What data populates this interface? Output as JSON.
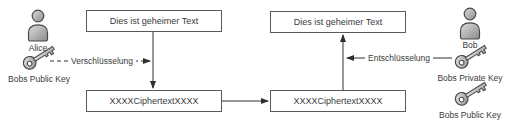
{
  "diagram": {
    "title_hint": "public-key encryption flow",
    "boxes": {
      "plaintext_left": "Dies ist geheimer Text",
      "plaintext_right": "Dies ist geheimer Text",
      "ciphertext_left": "XXXXCiphertextXXXX",
      "ciphertext_right": "XXXXCiphertextXXXX"
    },
    "arrows": {
      "encrypt_label": "Verschlüsselung",
      "decrypt_label": "Entschlüsselung"
    },
    "actors": {
      "alice": {
        "name": "Alice",
        "key_label": "Bobs Public Key"
      },
      "bob": {
        "name": "Bob",
        "private_key_label": "Bobs Private Key",
        "public_key_label": "Bobs Public Key"
      }
    },
    "colors": {
      "background": "#ffffff",
      "line": "#2e2e2e",
      "box_border": "#5a5a5a",
      "text": "#3a3a3a",
      "icon_light": "#dedede",
      "icon_dark": "#8a8a8a",
      "icon_stroke": "#4a4a4a"
    }
  }
}
